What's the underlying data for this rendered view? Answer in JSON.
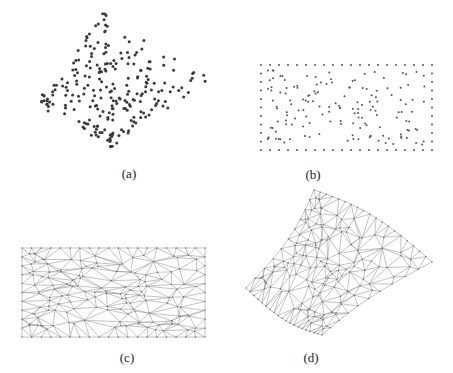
{
  "figure": {
    "panels": [
      {
        "id": "a",
        "label": "(a)",
        "description": "Scattered 3D point cloud",
        "label_pos": [
          129,
          166
        ]
      },
      {
        "id": "b",
        "label": "(b)",
        "description": "Points parameterized onto planar rectangle with boundary points",
        "label_pos": [
          313,
          167
        ]
      },
      {
        "id": "c",
        "label": "(c)",
        "description": "2D Delaunay triangulation in parameter rectangle",
        "label_pos": [
          127,
          350
        ]
      },
      {
        "id": "d",
        "label": "(d)",
        "description": "Triangulated 3D surface mesh",
        "label_pos": [
          311,
          350
        ]
      }
    ],
    "colors": {
      "point": "#3a3a3a",
      "point_b": "#555555",
      "mesh_edge": "#9a9a9a",
      "mesh_node": "#6a6a6a",
      "label": "#222222"
    },
    "geometry": {
      "a_corners": {
        "top": [
          102,
          12
        ],
        "left": [
          38,
          104
        ],
        "bottom": [
          112,
          147
        ],
        "right": [
          212,
          78
        ]
      },
      "b_rect": {
        "x": 261,
        "y": 65,
        "w": 171,
        "h": 85
      },
      "c_rect": {
        "x": 22,
        "y": 248,
        "w": 183,
        "h": 89
      },
      "d_corners": {
        "top": [
          314,
          190
        ],
        "left": [
          246,
          288
        ],
        "bottom": [
          322,
          335
        ],
        "right": [
          432,
          262
        ]
      }
    }
  }
}
